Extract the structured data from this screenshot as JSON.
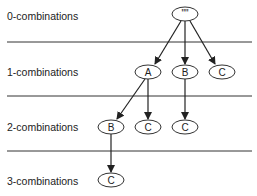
{
  "levels": [
    {
      "label": "0-combinations"
    },
    {
      "label": "1-combinations"
    },
    {
      "label": "2-combinations"
    },
    {
      "label": "3-combinations"
    }
  ],
  "nodes": [
    {
      "id": "root",
      "label": "\"\"",
      "level": 0
    },
    {
      "id": "a",
      "label": "A",
      "level": 1
    },
    {
      "id": "b",
      "label": "B",
      "level": 1
    },
    {
      "id": "c1",
      "label": "C",
      "level": 1
    },
    {
      "id": "ab",
      "label": "B",
      "level": 2
    },
    {
      "id": "ac",
      "label": "C",
      "level": 2
    },
    {
      "id": "bc",
      "label": "C",
      "level": 2
    },
    {
      "id": "abc",
      "label": "C",
      "level": 3
    }
  ],
  "edges": [
    [
      "root",
      "a"
    ],
    [
      "root",
      "b"
    ],
    [
      "root",
      "c1"
    ],
    [
      "a",
      "ab"
    ],
    [
      "a",
      "ac"
    ],
    [
      "b",
      "bc"
    ],
    [
      "ab",
      "abc"
    ]
  ]
}
